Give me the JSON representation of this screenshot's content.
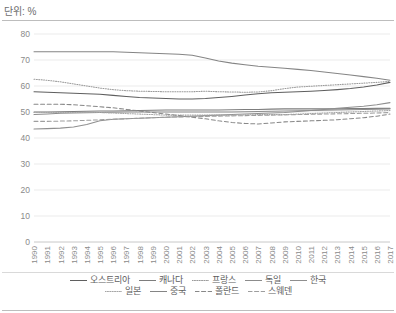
{
  "chart": {
    "unit_label": "단위: %",
    "type": "line"
  },
  "legend": {
    "rows": [
      [
        {
          "name": "austria",
          "label": "오스트리아"
        },
        {
          "name": "canada",
          "label": "캐나다"
        },
        {
          "name": "france",
          "label": "프랑스"
        },
        {
          "name": "germany",
          "label": "독일"
        },
        {
          "name": "korea",
          "label": "한국"
        }
      ],
      [
        {
          "name": "japan",
          "label": "일본"
        },
        {
          "name": "china",
          "label": "중국"
        },
        {
          "name": "poland",
          "label": "폴란드"
        },
        {
          "name": "sweden",
          "label": "스웨덴"
        }
      ]
    ]
  },
  "chart_data": {
    "type": "line",
    "title": "단위: %",
    "xlabel": "",
    "ylabel": "",
    "ylim": [
      0,
      80
    ],
    "yticks": [
      0,
      10,
      20,
      30,
      40,
      50,
      60,
      70,
      80
    ],
    "grid": true,
    "legend_position": "bottom",
    "x": [
      1990,
      1991,
      1992,
      1993,
      1994,
      1995,
      1996,
      1997,
      1998,
      1999,
      2000,
      2001,
      2002,
      2003,
      2004,
      2005,
      2006,
      2007,
      2008,
      2009,
      2010,
      2011,
      2012,
      2013,
      2014,
      2015,
      2016,
      2017
    ],
    "series": [
      {
        "name": "오스트리아",
        "key": "austria",
        "style": "solid",
        "color": "#5f5f5f",
        "values": [
          57.8,
          57.6,
          57.4,
          57.2,
          57.0,
          56.8,
          56.4,
          56.0,
          55.6,
          55.4,
          55.2,
          55.0,
          55.0,
          55.2,
          55.6,
          56.0,
          56.5,
          57.0,
          57.4,
          57.6,
          57.8,
          58.0,
          58.3,
          58.6,
          59.0,
          59.6,
          60.4,
          61.4
        ]
      },
      {
        "name": "캐나다",
        "key": "canada",
        "style": "solid",
        "color": "#7d7d7d",
        "values": [
          50.0,
          50.0,
          50.1,
          50.2,
          50.3,
          50.4,
          50.4,
          50.5,
          50.6,
          50.7,
          50.8,
          50.8,
          50.8,
          50.8,
          50.8,
          50.9,
          51.0,
          51.0,
          51.1,
          51.2,
          51.2,
          51.2,
          51.2,
          51.2,
          51.3,
          51.3,
          51.4,
          51.4
        ]
      },
      {
        "name": "프랑스",
        "key": "france",
        "style": "dotted",
        "color": "#9a9a9a",
        "values": [
          62.6,
          62.2,
          61.6,
          60.8,
          60.0,
          59.2,
          58.6,
          58.2,
          58.0,
          57.9,
          57.8,
          57.8,
          57.8,
          58.0,
          57.8,
          57.7,
          57.6,
          57.7,
          58.2,
          59.0,
          59.6,
          59.9,
          60.2,
          60.5,
          60.8,
          61.1,
          61.4,
          61.8
        ]
      },
      {
        "name": "독일",
        "key": "germany",
        "style": "solid",
        "color": "#8c8c8c",
        "values": [
          49.0,
          49.2,
          49.5,
          49.6,
          49.7,
          49.8,
          49.9,
          50.0,
          50.0,
          50.0,
          50.0,
          50.0,
          50.0,
          50.0,
          50.0,
          50.0,
          50.1,
          50.2,
          50.3,
          50.4,
          50.5,
          50.6,
          50.7,
          50.8,
          50.9,
          51.0,
          51.1,
          51.2
        ]
      },
      {
        "name": "한국",
        "key": "korea",
        "style": "solid",
        "color": "#8f8f8f",
        "values": [
          43.5,
          43.6,
          43.8,
          44.2,
          45.2,
          46.6,
          47.2,
          47.4,
          47.6,
          47.8,
          48.0,
          48.2,
          48.4,
          48.6,
          48.8,
          49.0,
          49.2,
          49.4,
          49.6,
          49.8,
          50.2,
          50.6,
          51.0,
          51.4,
          51.8,
          52.2,
          52.8,
          53.6
        ]
      },
      {
        "name": "일본",
        "key": "japan",
        "style": "dotted",
        "color": "#a5a5a5",
        "values": [
          49.8,
          49.8,
          49.8,
          49.8,
          49.8,
          49.8,
          49.6,
          49.4,
          49.2,
          49.0,
          48.8,
          48.8,
          48.8,
          48.8,
          48.8,
          48.8,
          48.9,
          49.0,
          49.0,
          49.0,
          49.2,
          49.4,
          49.6,
          49.8,
          50.0,
          50.2,
          50.4,
          50.6
        ]
      },
      {
        "name": "중국",
        "key": "china",
        "style": "solid",
        "color": "#858585",
        "values": [
          73.2,
          73.2,
          73.2,
          73.2,
          73.2,
          73.2,
          73.2,
          73.0,
          72.8,
          72.6,
          72.4,
          72.2,
          71.8,
          70.8,
          69.6,
          68.8,
          68.2,
          67.6,
          67.2,
          66.8,
          66.4,
          66.0,
          65.4,
          64.8,
          64.2,
          63.6,
          63.0,
          62.2
        ]
      },
      {
        "name": "폴란드",
        "key": "poland",
        "style": "dashed",
        "color": "#888888",
        "values": [
          53.0,
          53.0,
          53.0,
          52.8,
          52.4,
          52.0,
          51.6,
          51.0,
          50.4,
          49.8,
          49.2,
          48.6,
          48.0,
          47.4,
          46.6,
          46.0,
          45.6,
          45.4,
          45.8,
          46.2,
          46.4,
          46.6,
          46.8,
          47.0,
          47.4,
          47.8,
          48.4,
          49.2
        ]
      },
      {
        "name": "스웨덴",
        "key": "sweden",
        "style": "dashed",
        "color": "#9e9e9e",
        "values": [
          46.4,
          46.4,
          46.5,
          46.6,
          46.8,
          47.0,
          47.2,
          47.4,
          47.6,
          47.8,
          48.0,
          48.1,
          48.2,
          48.3,
          48.4,
          48.5,
          48.6,
          48.7,
          48.8,
          48.9,
          49.0,
          49.1,
          49.2,
          49.3,
          49.4,
          49.5,
          49.6,
          49.8
        ]
      }
    ]
  }
}
